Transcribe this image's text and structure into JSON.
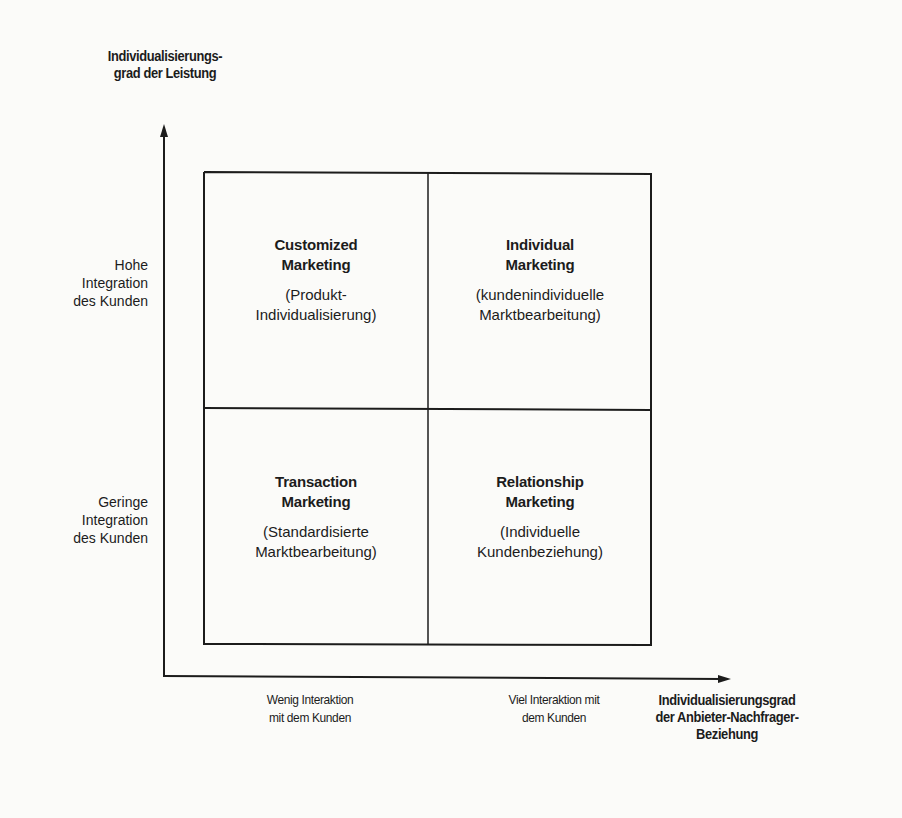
{
  "diagram": {
    "type": "2x2-matrix",
    "y_axis": {
      "title_lines": [
        "Individualisierungs-",
        "grad der Leistung"
      ],
      "levels": [
        {
          "label_lines": [
            "Hohe",
            "Integration",
            "des Kunden"
          ]
        },
        {
          "label_lines": [
            "Geringe",
            "Integration",
            "des Kunden"
          ]
        }
      ]
    },
    "x_axis": {
      "title_lines": [
        "Individualisierungsgrad",
        "der Anbieter-Nachfrager-",
        "Beziehung"
      ],
      "levels": [
        {
          "label_lines": [
            "Wenig Interaktion",
            "mit dem Kunden"
          ]
        },
        {
          "label_lines": [
            "Viel Interaktion mit",
            "dem Kunden"
          ]
        }
      ]
    },
    "quadrants": {
      "top_left": {
        "title_lines": [
          "Customized",
          "Marketing"
        ],
        "subtitle_lines": [
          "(Produkt-",
          "Individualisierung)"
        ]
      },
      "top_right": {
        "title_lines": [
          "Individual",
          "Marketing"
        ],
        "subtitle_lines": [
          "(kundenindividuelle",
          "Marktbearbeitung)"
        ]
      },
      "bottom_left": {
        "title_lines": [
          "Transaction",
          "Marketing"
        ],
        "subtitle_lines": [
          "(Standardisierte",
          "Marktbearbeitung)"
        ]
      },
      "bottom_right": {
        "title_lines": [
          "Relationship",
          "Marketing"
        ],
        "subtitle_lines": [
          "(Individuelle",
          "Kundenbeziehung)"
        ]
      }
    },
    "colors": {
      "background": "#fbfbf9",
      "ink": "#1c1c1c"
    }
  }
}
